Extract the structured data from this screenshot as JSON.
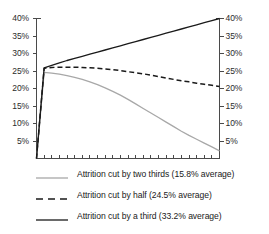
{
  "chart_data": {
    "type": "line",
    "title": "",
    "xlabel": "",
    "ylabel": "",
    "ylim": [
      0,
      40
    ],
    "xlim": [
      0,
      24
    ],
    "grid": false,
    "legend_position": "bottom",
    "y_tick_labels": [
      "40%",
      "35%",
      "30%",
      "25%",
      "20%",
      "15%",
      "10%",
      "5%"
    ],
    "y_tick_values": [
      40,
      35,
      30,
      25,
      20,
      15,
      10,
      5
    ],
    "right_axis_tick_labels": [
      "40%",
      "35%",
      "30%",
      "25%",
      "20%",
      "15%",
      "10%",
      "5%"
    ],
    "x_tick_count": 24,
    "x_tick_labels": [],
    "series": [
      {
        "name": "Attrition cut by two thirds (15.8% average)",
        "style": "solid",
        "color": "#a8a8a8",
        "average": 15.8,
        "x": [
          0,
          1,
          2,
          3,
          4,
          5,
          6,
          7,
          8,
          9,
          10,
          11,
          12,
          13,
          14,
          15,
          16,
          17,
          18,
          19,
          20,
          21,
          22,
          23,
          24
        ],
        "values": [
          0,
          24.6,
          24.4,
          24.1,
          23.7,
          23.2,
          22.6,
          21.9,
          21.1,
          20.2,
          19.2,
          18.1,
          16.9,
          15.6,
          14.3,
          13.0,
          11.7,
          10.4,
          9.1,
          7.8,
          6.6,
          5.5,
          4.4,
          3.3,
          2.2
        ]
      },
      {
        "name": "Attrition cut by half (24.5% average)",
        "style": "dashed",
        "color": "#1a1a1a",
        "average": 24.5,
        "x": [
          0,
          1,
          2,
          3,
          4,
          5,
          6,
          7,
          8,
          9,
          10,
          11,
          12,
          13,
          14,
          15,
          16,
          17,
          18,
          19,
          20,
          21,
          22,
          23,
          24
        ],
        "values": [
          0,
          25.8,
          26.0,
          26.1,
          26.1,
          26.1,
          26.0,
          25.9,
          25.8,
          25.6,
          25.4,
          25.1,
          24.8,
          24.5,
          24.2,
          23.8,
          23.4,
          23.0,
          22.6,
          22.2,
          21.9,
          21.5,
          21.2,
          20.9,
          20.6
        ]
      },
      {
        "name": "Attrition cut by a third (33.2% average)",
        "style": "solid",
        "color": "#1a1a1a",
        "average": 33.2,
        "x": [
          0,
          1,
          2,
          3,
          4,
          5,
          6,
          7,
          8,
          9,
          10,
          11,
          12,
          13,
          14,
          15,
          16,
          17,
          18,
          19,
          20,
          21,
          22,
          23,
          24
        ],
        "values": [
          0,
          25.9,
          26.6,
          27.3,
          28.0,
          28.6,
          29.2,
          29.8,
          30.4,
          31.0,
          31.6,
          32.2,
          32.8,
          33.4,
          34.0,
          34.6,
          35.2,
          35.8,
          36.4,
          37.0,
          37.6,
          38.2,
          38.8,
          39.4,
          40.0
        ]
      }
    ]
  },
  "legend": {
    "items": [
      {
        "label": "Attrition cut by two thirds (15.8% average)",
        "style": "solid",
        "color": "#a8a8a8"
      },
      {
        "label": "Attrition cut by half (24.5% average)",
        "style": "dashed",
        "color": "#1a1a1a"
      },
      {
        "label": "Attrition cut by a third (33.2% average)",
        "style": "solid",
        "color": "#1a1a1a"
      }
    ]
  },
  "axis_colors": {
    "spine": "#4a4a4a",
    "tick": "#4a4a4a",
    "text": "#2b2b2b"
  }
}
